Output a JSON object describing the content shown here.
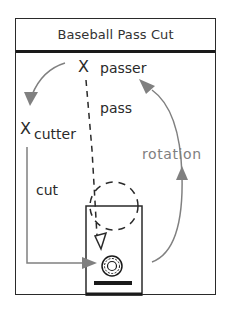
{
  "title": "Baseball Pass Cut",
  "labels": {
    "passer_mark": "X",
    "passer": "passer",
    "pass": "pass",
    "cutter_mark": "X",
    "cutter": "cutter",
    "cut": "cut",
    "rotation": "rotation"
  },
  "icons": {
    "passer": "x-mark",
    "cutter": "x-mark",
    "defender": "triangle-down",
    "ball_target": "ball-circle",
    "basket_base": "bar"
  },
  "colors": {
    "ink": "#2a2a2a",
    "arrow_gray": "#808080",
    "background": "#ffffff"
  }
}
